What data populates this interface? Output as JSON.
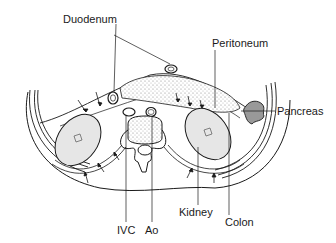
{
  "diagram": {
    "type": "anatomical-cross-section",
    "labels": {
      "duodenum": "Duodenum",
      "peritoneum": "Peritoneum",
      "pancreas": "Pancreas",
      "ivc": "IVC",
      "aorta": "Ao",
      "kidney": "Kidney",
      "colon": "Colon"
    },
    "colors": {
      "line": "#1a1a1a",
      "fill_light": "#e6e6e6",
      "fill_stipple": "#bdbdbd",
      "background": "#ffffff"
    }
  }
}
